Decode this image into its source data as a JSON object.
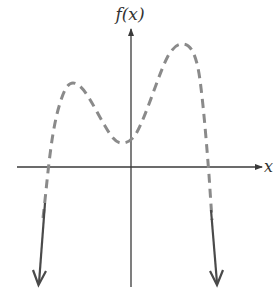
{
  "figure": {
    "y_axis_label": "f(x)",
    "x_axis_label": "x",
    "curve_style": "dashed",
    "end_behavior": {
      "left": "down",
      "right": "down"
    }
  },
  "colors": {
    "axis": "#3a3a3a",
    "curve": "#8a8a8a",
    "arrows": "#4a4a4a",
    "background": "#ffffff"
  },
  "features": {
    "left_local_max": "x < 0, f > 0",
    "local_min": "near x = 0, f > 0",
    "right_local_max": "x > 0, f > 0 (highest)",
    "x_intercepts": 2
  }
}
